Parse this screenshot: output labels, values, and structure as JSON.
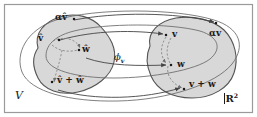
{
  "figure": {
    "name": "vector-space-isomorphism-diagram",
    "frame": {
      "border_color": "#9a9a9a",
      "background": "#ffffff"
    },
    "palette": {
      "blob_fill": "#d8d8d8",
      "blob_stroke": "#555555",
      "ellipse_stroke": "#666666",
      "arrow_solid": "#444444",
      "arrow_dashed": "#777777",
      "text": "#1a1a1a"
    },
    "domain_label": "V",
    "codomain_label": "R",
    "codomain_exponent": "2",
    "map_label": "ϕ",
    "map_label_subscript": "v",
    "left_points": [
      {
        "id": "alpha-v-hat",
        "label_base": "αv",
        "hat": "ˆ",
        "x": 62,
        "y": 21
      },
      {
        "id": "v-hat",
        "label_base": "v",
        "hat": "ˆ",
        "x": 44,
        "y": 41
      },
      {
        "id": "w-hat",
        "label_base": "w",
        "hat": "ˆ",
        "x": 84,
        "y": 50
      },
      {
        "id": "v-hat-plus-w-hat",
        "label_base": "v + w",
        "hat": "ˆ",
        "x": 60,
        "y": 80
      }
    ],
    "right_points": [
      {
        "id": "v",
        "label": "v",
        "x": 173,
        "y": 34
      },
      {
        "id": "alpha-v",
        "label": "αv",
        "x": 212,
        "y": 32
      },
      {
        "id": "w",
        "label": "w",
        "x": 180,
        "y": 65
      },
      {
        "id": "v-plus-w",
        "label": "v + w",
        "x": 190,
        "y": 84
      }
    ],
    "left_labels": {
      "alpha_v_hat": "αv̂",
      "v_hat": "v̂",
      "w_hat": "ŵ",
      "v_hat_plus_w_hat": "v̂ + ŵ"
    },
    "right_labels": {
      "v": "v",
      "alpha_v": "αv",
      "w": "w",
      "v_plus_w": "v + w"
    }
  }
}
